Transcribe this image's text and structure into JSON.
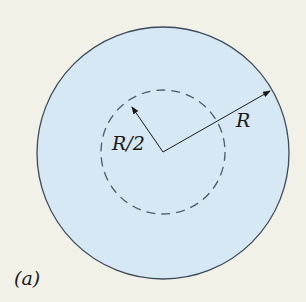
{
  "figure": {
    "panel_label": "(a)",
    "outer_radius_label": "R",
    "inner_radius_label": "R/2",
    "colors": {
      "background": "#f1f1e8",
      "disk_fill": "#d6e8f4",
      "outline": "#3c4a5a",
      "dashed": "#4a5a70",
      "arrow": "#1a1a1a"
    }
  }
}
